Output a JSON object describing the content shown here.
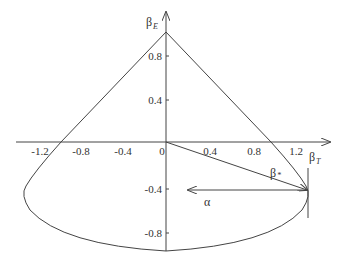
{
  "diagram": {
    "type": "region-plot",
    "axes": {
      "x": {
        "label": "β",
        "label_sub": "T",
        "ticks": [
          "-1.2",
          "-0.8",
          "-0.4",
          "0",
          "0.4",
          "0.8",
          "1.2"
        ]
      },
      "y": {
        "label": "β",
        "label_sub": "E",
        "ticks": [
          "0.8",
          "0.4",
          "-0.4",
          "-0.8"
        ]
      }
    },
    "annotations": {
      "vector_label": "β",
      "vector_label_sub": "*",
      "alpha_label": "α"
    },
    "shape": {
      "apex": [
        0,
        1.05
      ],
      "right_x_intercept": 1.0,
      "left_x_intercept": -1.0,
      "leftmost": [
        -1.35,
        -0.45
      ],
      "rightmost": [
        1.35,
        -0.45
      ],
      "bottom": [
        0,
        -0.98
      ]
    },
    "colors": {
      "line": "#444444",
      "text": "#333333"
    }
  }
}
